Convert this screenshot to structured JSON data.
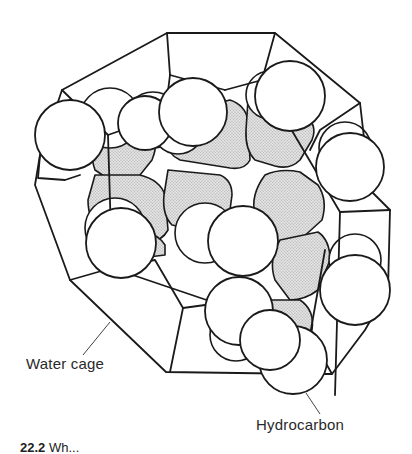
{
  "figure": {
    "labels": {
      "water_cage": "Water cage",
      "hydrocarbon": "Hydrocarbon"
    },
    "caption": {
      "number": "22.2",
      "text": "Wh..."
    },
    "colors": {
      "stroke": "#1a1a1a",
      "shaded": "#d4d4d4",
      "background": "#ffffff"
    }
  }
}
